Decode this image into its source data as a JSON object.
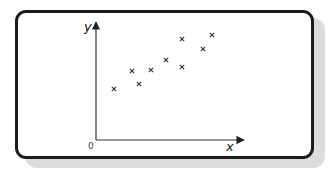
{
  "chart_data": {
    "type": "scatter",
    "title": "",
    "xlabel": "x",
    "ylabel": "y",
    "origin_label": "0",
    "xlim": [
      0,
      14.8
    ],
    "ylim": [
      0,
      11.8
    ],
    "grid": false,
    "legend": null,
    "marker": "x",
    "points": [
      {
        "x": 1.8,
        "y": 5.1
      },
      {
        "x": 3.6,
        "y": 6.9
      },
      {
        "x": 4.3,
        "y": 5.6
      },
      {
        "x": 5.5,
        "y": 7.0
      },
      {
        "x": 7.0,
        "y": 8.0
      },
      {
        "x": 8.6,
        "y": 10.1
      },
      {
        "x": 8.6,
        "y": 7.3
      },
      {
        "x": 10.7,
        "y": 9.1
      },
      {
        "x": 11.6,
        "y": 10.5
      }
    ],
    "x": [
      1.8,
      3.6,
      4.3,
      5.5,
      7.0,
      8.6,
      8.6,
      10.7,
      11.6
    ],
    "values": [
      5.1,
      6.9,
      5.6,
      7.0,
      8.0,
      10.1,
      7.3,
      9.1,
      10.5
    ],
    "annotations": []
  },
  "labels": {
    "x_axis": "x",
    "y_axis": "y",
    "origin": "0"
  },
  "colors": {
    "frame": "#1a1a1a",
    "shadow": "#dcdcdc",
    "axis": "#333333",
    "marker": "#333333"
  }
}
